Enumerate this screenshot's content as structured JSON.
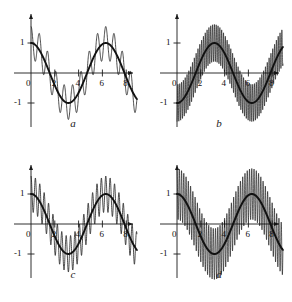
{
  "figure": {
    "background": "#ffffff",
    "ink": "#1a1a1a",
    "panel_count": 4
  },
  "chart_data": [
    {
      "type": "line",
      "panel": "a",
      "caption": "a",
      "title": "",
      "xlabel": "",
      "ylabel": "",
      "xlim": [
        -0.6,
        9.4
      ],
      "ylim": [
        -1.75,
        1.75
      ],
      "xticks": [
        0,
        2,
        4,
        6,
        8
      ],
      "xticklabels": [
        "0",
        "2",
        "4",
        "6",
        "8"
      ],
      "yticks": [
        -1,
        1
      ],
      "yticklabels": [
        "-1",
        "1"
      ],
      "y_label_top": "1",
      "y_label_bottom": "-1",
      "grid": false,
      "legend": "none",
      "series": [
        {
          "name": "carrier",
          "kind": "smooth",
          "linewidth": 1.9,
          "color": "#111111",
          "formula": "cos(x)",
          "amplitude": 1.0,
          "period": 6.283
        },
        {
          "name": "oscillation",
          "kind": "high-frequency",
          "linewidth": 0.8,
          "color": "#111111",
          "formula": "cos(x) + 0.55*cos(9*x)",
          "carrier_amplitude": 1.0,
          "modulation_amplitude": 0.55,
          "modulation_frequency": 9,
          "samples": 900
        }
      ]
    },
    {
      "type": "line",
      "panel": "b",
      "caption": "b",
      "title": "",
      "xlabel": "",
      "ylabel": "",
      "xlim": [
        -0.6,
        9.4
      ],
      "ylim": [
        -1.75,
        1.75
      ],
      "xticks": [
        0,
        2,
        4,
        6,
        8
      ],
      "xticklabels": [
        "0",
        "2",
        "4",
        "6",
        "8"
      ],
      "yticks": [
        -1,
        1
      ],
      "yticklabels": [
        "-1",
        "1"
      ],
      "y_label_top": "-1",
      "y_label_bottom": "1",
      "y_axis_inverted": true,
      "grid": false,
      "legend": "none",
      "series": [
        {
          "name": "carrier",
          "kind": "smooth",
          "linewidth": 1.9,
          "color": "#111111",
          "formula": "-cos(x)",
          "amplitude": 1.0,
          "period": 6.283
        },
        {
          "name": "oscillation",
          "kind": "high-frequency",
          "linewidth": 0.7,
          "color": "#111111",
          "formula": "-cos(x) + 0.62*cos(41*x)",
          "carrier_amplitude": 1.0,
          "modulation_amplitude": 0.62,
          "modulation_frequency": 41,
          "samples": 2200
        }
      ]
    },
    {
      "type": "line",
      "panel": "c",
      "caption": "c",
      "title": "",
      "xlabel": "",
      "ylabel": "",
      "xlim": [
        -0.6,
        9.4
      ],
      "ylim": [
        -1.75,
        1.75
      ],
      "xticks": [
        0,
        2,
        4,
        6,
        8
      ],
      "xticklabels": [
        "0",
        "2",
        "4",
        "6",
        "8"
      ],
      "yticks": [
        -1,
        1
      ],
      "yticklabels": [
        "-1",
        "1"
      ],
      "y_label_top": "1",
      "y_label_bottom": "-1",
      "grid": false,
      "legend": "none",
      "series": [
        {
          "name": "carrier",
          "kind": "smooth",
          "linewidth": 1.9,
          "color": "#111111",
          "formula": "cos(x)",
          "amplitude": 1.0,
          "period": 6.283
        },
        {
          "name": "oscillation",
          "kind": "high-frequency",
          "linewidth": 0.8,
          "color": "#111111",
          "formula": "cos(x) + 0.60*cos(17*x)",
          "carrier_amplitude": 1.0,
          "modulation_amplitude": 0.6,
          "modulation_frequency": 17,
          "samples": 1200
        }
      ]
    },
    {
      "type": "line",
      "panel": "d",
      "caption": "d",
      "title": "",
      "xlabel": "",
      "ylabel": "",
      "xlim": [
        -0.6,
        9.4
      ],
      "ylim": [
        -1.75,
        1.75
      ],
      "xticks": [
        0,
        2,
        4,
        6,
        8
      ],
      "xticklabels": [
        "0",
        "2",
        "4",
        "6",
        "8"
      ],
      "yticks": [
        -1,
        1
      ],
      "yticklabels": [
        "-1",
        "1"
      ],
      "y_label_top": "1",
      "y_label_bottom": "-1",
      "grid": false,
      "legend": "none",
      "series": [
        {
          "name": "carrier",
          "kind": "smooth",
          "linewidth": 2.0,
          "color": "#111111",
          "formula": "cos(x)",
          "amplitude": 1.0,
          "period": 6.283
        },
        {
          "name": "oscillation",
          "kind": "high-frequency",
          "linewidth": 0.7,
          "color": "#111111",
          "formula": "cos(x) + 0.85*cos(33*x)",
          "carrier_amplitude": 1.0,
          "modulation_amplitude": 0.85,
          "modulation_frequency": 33,
          "samples": 1800
        }
      ]
    }
  ],
  "panels": {
    "a": {
      "caption": "a",
      "y_top": "1",
      "y_bottom": "-1",
      "x_labels": [
        "0",
        "2",
        "4",
        "6",
        "8"
      ]
    },
    "b": {
      "caption": "b",
      "y_top": "-1",
      "y_bottom": "1",
      "x_labels": [
        "0",
        "2",
        "4",
        "6",
        "8"
      ]
    },
    "c": {
      "caption": "c",
      "y_top": "1",
      "y_bottom": "-1",
      "x_labels": [
        "0",
        "2",
        "4",
        "6",
        "8"
      ]
    },
    "d": {
      "caption": "d",
      "y_top": "1",
      "y_bottom": "-1",
      "x_labels": [
        "0",
        "2",
        "4",
        "6",
        "8"
      ]
    }
  }
}
